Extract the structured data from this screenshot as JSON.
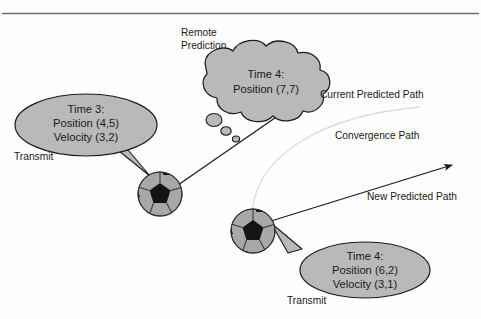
{
  "figure": {
    "title_rule": "top-horizontal-rule",
    "background_color": "#fefefe",
    "shape_fill": "#b9b9b9",
    "stroke_color": "#1a1a1a",
    "ball_base_color": "#a8a8a8",
    "ball_patch_color": "#141414"
  },
  "annotations": {
    "remote_prediction_line1": "Remote",
    "remote_prediction_line2": "Prediction",
    "transmit_left": "Transmit",
    "transmit_right": "Transmit",
    "current_predicted_path": "Current Predicted Path",
    "convergence_path": "Convergence Path",
    "new_predicted_path": "New Predicted Path"
  },
  "cloud_bubble": {
    "line1": "Time 4:",
    "line2": "Position (7,7)"
  },
  "left_bubble": {
    "line1": "Time 3:",
    "line2": "Position (4,5)",
    "line3": "Velocity (3,2)"
  },
  "right_bubble": {
    "line1": "Time 4:",
    "line2": "Position (6,2)",
    "line3": "Velocity (3,1)"
  }
}
